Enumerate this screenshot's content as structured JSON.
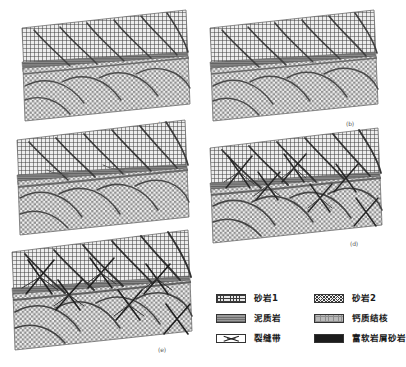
{
  "figure": {
    "type": "geological-block-diagram-series",
    "panel_count": 5
  },
  "panels": [
    {
      "id": "a",
      "label": "(a)",
      "stage_index": 1,
      "has_fracture_zones": false,
      "fracture_zone_count": 0,
      "shear_band_count": 6,
      "upper_unit": "sandstone-1",
      "lower_unit": "sandstone-2",
      "marker_band": "mudstone"
    },
    {
      "id": "b",
      "label": "(b)",
      "stage_index": 2,
      "has_fracture_zones": false,
      "fracture_zone_count": 0,
      "shear_band_count": 6,
      "upper_unit": "sandstone-1",
      "lower_unit": "sandstone-2",
      "marker_band": "mudstone"
    },
    {
      "id": "c",
      "label": "(c)",
      "stage_index": 3,
      "has_fracture_zones": false,
      "fracture_zone_count": 0,
      "shear_band_count": 6,
      "upper_unit": "sandstone-1",
      "lower_unit": "sandstone-2",
      "marker_band": "mudstone"
    },
    {
      "id": "d",
      "label": "(d)",
      "stage_index": 4,
      "has_fracture_zones": true,
      "fracture_zone_count": 6,
      "shear_band_count": 6,
      "upper_unit": "sandstone-1",
      "lower_unit": "sandstone-2",
      "marker_band": "mudstone"
    },
    {
      "id": "e",
      "label": "(e)",
      "stage_index": 5,
      "has_fracture_zones": true,
      "fracture_zone_count": 6,
      "shear_band_count": 6,
      "upper_unit": "sandstone-1",
      "lower_unit": "sandstone-2",
      "marker_band": "mudstone"
    }
  ],
  "legend": {
    "items": [
      {
        "key": "sandstone-1",
        "label": "砂岩1",
        "swatch": "grid-hatch",
        "color": "#e8e8e8"
      },
      {
        "key": "sandstone-2",
        "label": "砂岩2",
        "swatch": "diagonal-cross",
        "color": "#f0f0f0"
      },
      {
        "key": "mudstone",
        "label": "泥质岩",
        "swatch": "solid-gray-lines",
        "color": "#8a8a8a"
      },
      {
        "key": "calcareous-nodule",
        "label": "钙质结核",
        "swatch": "fine-dot-grid",
        "color": "#b9b9b9"
      },
      {
        "key": "fracture-zone",
        "label": "裂缝带",
        "swatch": "x-bowtie",
        "color": "#ffffff"
      },
      {
        "key": "soft-debris-rich-sandstone",
        "label": "富软岩屑砂岩",
        "swatch": "solid-black",
        "color": "#1c1c1c"
      }
    ]
  },
  "colors": {
    "ink": "#1a1a1a",
    "hatch": "#3a3a3a",
    "mudstone_band": "#6f6f6f",
    "shear_line": "#4a4a4a",
    "fracture_line": "#2a2a2a",
    "panel_outline": "#555555",
    "background": "#ffffff"
  }
}
